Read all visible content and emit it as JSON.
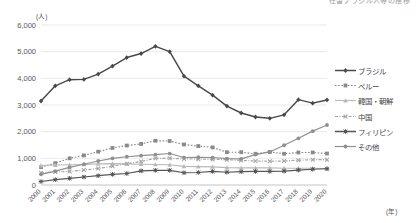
{
  "clipped_title": "在留ブラジル人等の推移",
  "axes": {
    "y_unit": "(人)",
    "x_unit": "(年)",
    "y_ticks": [
      "0",
      "1,000",
      "2,000",
      "3,000",
      "4,000",
      "5,000",
      "6,000"
    ]
  },
  "legend": {
    "items": [
      {
        "label": "ブラジル",
        "color": "#4a4a4a",
        "marker": "diamond",
        "dash": "solid"
      },
      {
        "label": "ペルー",
        "color": "#8a8a8a",
        "marker": "square",
        "dash": "dotted"
      },
      {
        "label": "韓国・朝鮮",
        "color": "#b9b9b9",
        "marker": "triangle",
        "dash": "solid"
      },
      {
        "label": "中国",
        "color": "#a5a5a5",
        "marker": "cross",
        "dash": "dashdot"
      },
      {
        "label": "フィリピン",
        "color": "#555555",
        "marker": "star",
        "dash": "solid"
      },
      {
        "label": "その他",
        "color": "#8f8f8f",
        "marker": "circle",
        "dash": "solid"
      }
    ]
  },
  "chart_data": {
    "type": "line",
    "title": "在留ブラジル人等の推移",
    "xlabel": "(年)",
    "ylabel": "(人)",
    "ylim": [
      0,
      6000
    ],
    "ytick_step": 1000,
    "grid": true,
    "legend_position": "right",
    "categories": [
      "2000",
      "2001",
      "2002",
      "2003",
      "2004",
      "2005",
      "2006",
      "2007",
      "2008",
      "2009",
      "2010",
      "2011",
      "2012",
      "2013",
      "2014",
      "2015",
      "2016",
      "2017",
      "2018",
      "2019",
      "2020"
    ],
    "series": [
      {
        "name": "ブラジル",
        "values": [
          3150,
          3720,
          3950,
          3960,
          4160,
          4460,
          4780,
          4930,
          5200,
          5000,
          4080,
          3720,
          3370,
          2960,
          2700,
          2550,
          2500,
          2630,
          3200,
          3070,
          3190
        ]
      },
      {
        "name": "ペルー",
        "values": [
          670,
          820,
          1000,
          1110,
          1250,
          1390,
          1480,
          1540,
          1660,
          1650,
          1520,
          1460,
          1410,
          1230,
          1230,
          1170,
          1240,
          1170,
          1220,
          1220,
          1180
        ]
      },
      {
        "name": "韓国・朝鮮",
        "values": [
          730,
          750,
          760,
          770,
          790,
          800,
          790,
          780,
          770,
          760,
          700,
          690,
          680,
          650,
          640,
          640,
          640,
          630,
          630,
          630,
          620
        ]
      },
      {
        "name": "中国",
        "values": [
          460,
          490,
          510,
          560,
          620,
          700,
          800,
          880,
          1000,
          1000,
          980,
          970,
          960,
          950,
          920,
          900,
          890,
          900,
          930,
          950,
          950
        ]
      },
      {
        "name": "フィリピン",
        "values": [
          130,
          200,
          250,
          300,
          350,
          400,
          430,
          530,
          550,
          550,
          460,
          470,
          510,
          480,
          500,
          510,
          510,
          520,
          560,
          590,
          610
        ]
      },
      {
        "name": "その他",
        "values": [
          400,
          520,
          660,
          780,
          900,
          1000,
          1060,
          1100,
          1140,
          1180,
          1030,
          1040,
          1030,
          990,
          980,
          1140,
          1240,
          1490,
          1750,
          2020,
          2250
        ]
      }
    ]
  }
}
